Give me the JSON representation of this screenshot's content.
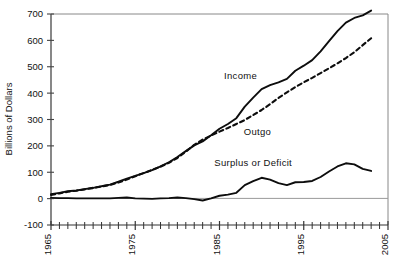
{
  "chart_data": {
    "type": "line",
    "title": "",
    "subtitle": "",
    "xlabel": "",
    "ylabel": "Billions of Dollars",
    "xlim": [
      1965,
      2005
    ],
    "ylim": [
      -100,
      700
    ],
    "ytick_values": [
      -100,
      0,
      100,
      200,
      300,
      400,
      500,
      600,
      700
    ],
    "ytick_labels": [
      "-100",
      "0",
      "100",
      "200",
      "300",
      "400",
      "500",
      "600",
      "700"
    ],
    "xtick_labels": [
      "1965",
      "1975",
      "1985",
      "1995",
      "2005"
    ],
    "xtick_labeled_values": [
      1965,
      1975,
      1985,
      1995,
      2005
    ],
    "xtick_minor_step": 1,
    "grid": false,
    "legend_position": "inline-annotations",
    "zero_line": 0,
    "annotations": [
      {
        "text": "Income",
        "x": 1987.5,
        "y": 455,
        "name": "income"
      },
      {
        "text": "Outgo",
        "x": 1989.5,
        "y": 240,
        "name": "outgo"
      },
      {
        "text": "Surplus  or  Deficit",
        "x": 1989,
        "y": 123,
        "name": "surplus-or-deficit"
      }
    ],
    "x": [
      1965,
      1966,
      1967,
      1968,
      1969,
      1970,
      1971,
      1972,
      1973,
      1974,
      1975,
      1976,
      1977,
      1978,
      1979,
      1980,
      1981,
      1982,
      1983,
      1984,
      1985,
      1986,
      1987,
      1988,
      1989,
      1990,
      1991,
      1992,
      1993,
      1994,
      1995,
      1996,
      1997,
      1998,
      1999,
      2000,
      2001,
      2002,
      2003
    ],
    "series": [
      {
        "name": "Income",
        "style": "solid",
        "values": [
          17,
          22,
          28,
          31,
          36,
          41,
          47,
          53,
          64,
          76,
          86,
          97,
          108,
          122,
          138,
          158,
          180,
          202,
          217,
          240,
          265,
          283,
          305,
          349,
          383,
          415,
          430,
          441,
          454,
          485,
          504,
          525,
          558,
          597,
          635,
          667,
          685,
          695,
          713
        ]
      },
      {
        "name": "Outgo",
        "style": "dashed",
        "values": [
          14,
          20,
          26,
          30,
          35,
          40,
          46,
          52,
          61,
          72,
          85,
          97,
          109,
          121,
          136,
          154,
          178,
          204,
          224,
          239,
          254,
          268,
          283,
          298,
          317,
          336,
          358,
          382,
          403,
          423,
          441,
          458,
          476,
          494,
          513,
          533,
          555,
          582,
          608
        ]
      },
      {
        "name": "Surplus or Deficit",
        "style": "solid",
        "values": [
          3,
          2,
          2,
          1,
          1,
          1,
          1,
          1,
          3,
          4,
          1,
          0,
          -1,
          1,
          2,
          4,
          2,
          -2,
          -7,
          1,
          11,
          15,
          22,
          51,
          66,
          79,
          72,
          59,
          51,
          62,
          63,
          67,
          82,
          103,
          122,
          134,
          130,
          113,
          105
        ]
      }
    ]
  },
  "axis": {
    "y_title": "Billions of Dollars"
  }
}
